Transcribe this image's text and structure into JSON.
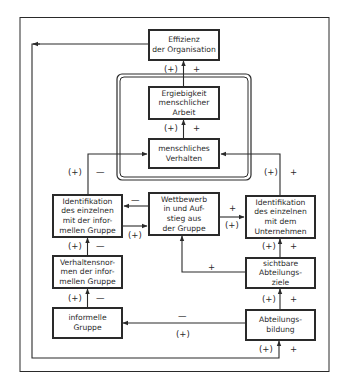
{
  "diagram": {
    "colors": {
      "line": "#2a2a2a",
      "background": "#ffffff"
    },
    "nodes": {
      "effizienz": "Effizienz\nder Organisation",
      "ergiebigkeit": "Ergiebigkeit\nmenschlicher\nArbeit",
      "verhalten": "menschliches\nVerhalten",
      "ident_informell": "Identifikation\ndes einzelnen\nmit der infor-\nmellen Gruppe",
      "wettbewerb": "Wettbewerb\nin und Auf-\nstieg aus\nder Gruppe",
      "ident_unternehmen": "Identifikation\ndes einzelnen\nmit dem\nUnternehmen",
      "verhaltensnormen": "Verhaltensnor-\nmen der infor-\nmellen Gruppe",
      "sichtbare_ziele": "sichtbare\nAbteilungs-\nziele",
      "informelle_gruppe": "informelle\nGruppe",
      "abteilungsbildung": "Abteilungs-\nbildung"
    },
    "edges": [
      {
        "from": "ergiebigkeit",
        "to": "effizienz",
        "sign_a": "(+)",
        "sign_b": "+"
      },
      {
        "from": "verhalten",
        "to": "ergiebigkeit",
        "sign_a": "(+)",
        "sign_b": "+"
      },
      {
        "from": "ident_informell",
        "to": "verhalten",
        "sign_a": "(+)",
        "sign_b": "—"
      },
      {
        "from": "ident_unternehmen",
        "to": "verhalten",
        "sign_a": "(+)",
        "sign_b": "+"
      },
      {
        "from": "wettbewerb",
        "to": "ident_informell",
        "sign_a": "—"
      },
      {
        "from": "ident_informell",
        "to": "wettbewerb",
        "sign_a": "(+)"
      },
      {
        "from": "wettbewerb",
        "to": "ident_unternehmen",
        "sign_a": "+",
        "sign_b": "(+)"
      },
      {
        "from": "verhaltensnormen",
        "to": "ident_informell",
        "sign_a": "(+)",
        "sign_b": "—"
      },
      {
        "from": "sichtbare_ziele",
        "to": "wettbewerb",
        "sign_a": "+"
      },
      {
        "from": "sichtbare_ziele",
        "to": "ident_unternehmen",
        "sign_a": "(+)",
        "sign_b": "+"
      },
      {
        "from": "informelle_gruppe",
        "to": "verhaltensnormen",
        "sign_a": "(+)",
        "sign_b": "—"
      },
      {
        "from": "abteilungsbildung",
        "to": "sichtbare_ziele",
        "sign_a": "(+)",
        "sign_b": "+"
      },
      {
        "from": "abteilungsbildung",
        "to": "informelle_gruppe",
        "sign_a": "—",
        "sign_b": "(+)"
      },
      {
        "from": "effizienz",
        "to": "abteilungsbildung",
        "sign_a": "(+)",
        "sign_b": "+",
        "note": "feedback loop via left/bottom"
      }
    ],
    "labels": {
      "l1a": "(+)",
      "l1b": "+",
      "l2a": "(+)",
      "l2b": "+",
      "l3a": "(+)",
      "l3b": "—",
      "l4a": "(+)",
      "l4b": "+",
      "l5": "—",
      "l6": "(+)",
      "l7a": "+",
      "l7b": "(+)",
      "l8a": "(+)",
      "l8b": "—",
      "l9": "+",
      "l10a": "(+)",
      "l10b": "+",
      "l11a": "(+)",
      "l11b": "—",
      "l12a": "(+)",
      "l12b": "+",
      "l13a": "—",
      "l13b": "(+)",
      "l14a": "(+)",
      "l14b": "+"
    }
  }
}
